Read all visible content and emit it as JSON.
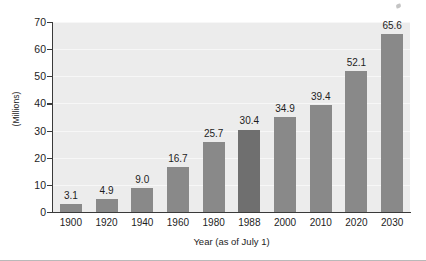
{
  "chart_data": {
    "type": "bar",
    "title": "",
    "subtitle": "",
    "xlabel": "Year (as of July 1)",
    "ylabel": "(Millions)",
    "categories": [
      "1900",
      "1920",
      "1940",
      "1960",
      "1980",
      "1988",
      "2000",
      "2010",
      "2020",
      "2030"
    ],
    "values": [
      3.1,
      4.9,
      9.0,
      16.7,
      25.7,
      30.4,
      34.9,
      39.4,
      52.1,
      65.6
    ],
    "value_labels": [
      "3.1",
      "4.9",
      "9.0",
      "16.7",
      "25.7",
      "30.4",
      "34.9",
      "39.4",
      "52.1",
      "65.6"
    ],
    "ylim": [
      0,
      70
    ],
    "yticks": [
      0,
      10,
      20,
      30,
      40,
      50,
      60,
      70
    ],
    "ytick_labels": [
      "0",
      "10",
      "20",
      "30",
      "40",
      "50",
      "60",
      "70"
    ],
    "grid": true,
    "legend": false,
    "highlight_index": 5,
    "colors": {
      "bar": "#898989",
      "bar_highlight": "#6f6f6f",
      "plot_background": "#ececec",
      "gridline": "#f7f7f7",
      "axis": "#3a3a3a",
      "text": "#1d1d1d",
      "page_background": "#ffffff"
    }
  }
}
